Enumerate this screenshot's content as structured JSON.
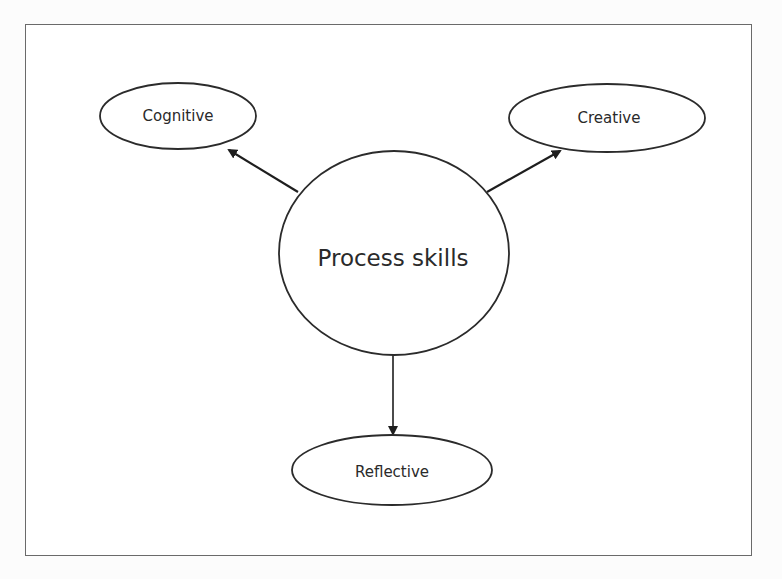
{
  "diagram": {
    "center": {
      "label": "Process skills",
      "shape": "circle",
      "cx": 394,
      "cy": 253,
      "rx": 115,
      "ry": 102
    },
    "nodes": [
      {
        "id": "cognitive",
        "label": "Cognitive",
        "shape": "ellipse",
        "cx": 178,
        "cy": 116,
        "rx": 78,
        "ry": 33
      },
      {
        "id": "creative",
        "label": "Creative",
        "shape": "ellipse",
        "cx": 607,
        "cy": 118,
        "rx": 98,
        "ry": 34
      },
      {
        "id": "reflective",
        "label": "Reflective",
        "shape": "ellipse",
        "cx": 392,
        "cy": 470,
        "rx": 100,
        "ry": 35
      }
    ],
    "edges": [
      {
        "from": "process-skills",
        "to": "cognitive",
        "x1": 298,
        "y1": 192,
        "x2": 229,
        "y2": 150
      },
      {
        "from": "process-skills",
        "to": "creative",
        "x1": 487,
        "y1": 192,
        "x2": 560,
        "y2": 151
      },
      {
        "from": "process-skills",
        "to": "reflective",
        "x1": 393,
        "y1": 355,
        "x2": 393,
        "y2": 434
      }
    ],
    "colors": {
      "stroke": "#2b2b2b",
      "frame": "#6a6a6a",
      "text": "#2a2a2a",
      "background": "#ffffff"
    }
  }
}
